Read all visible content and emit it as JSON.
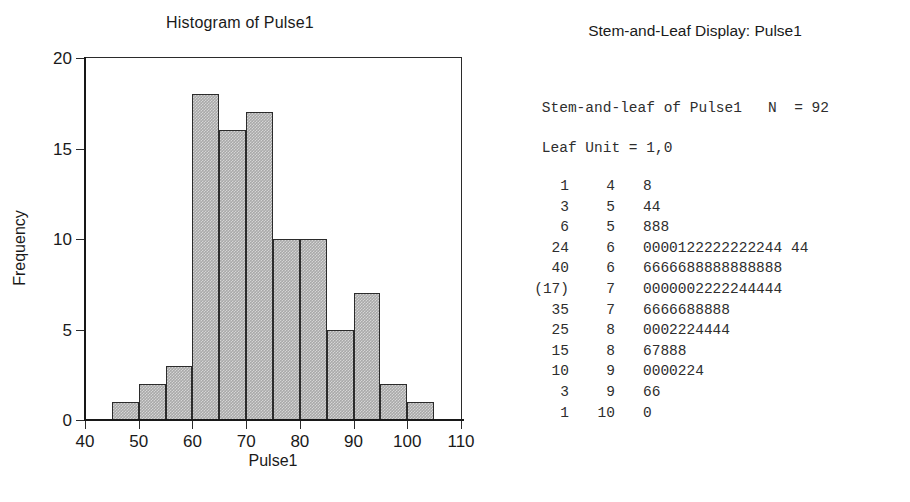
{
  "histogram": {
    "title": "Histogram of Pulse1",
    "xlabel": "Pulse1",
    "ylabel": "Frequency"
  },
  "stemleaf": {
    "title": "Stem-and-Leaf Display: Pulse1",
    "header_line1": "Stem-and-leaf of Pulse1   N  = 92",
    "header_line2": "Leaf Unit = 1,0",
    "rows": [
      {
        "count": "1",
        "stem": "4",
        "leaves": "8"
      },
      {
        "count": "3",
        "stem": "5",
        "leaves": "44"
      },
      {
        "count": "6",
        "stem": "5",
        "leaves": "888"
      },
      {
        "count": "24",
        "stem": "6",
        "leaves": "0000122222222244 44"
      },
      {
        "count": "40",
        "stem": "6",
        "leaves": "6666688888888888"
      },
      {
        "count": "(17)",
        "stem": "7",
        "leaves": "0000002222244444"
      },
      {
        "count": "35",
        "stem": "7",
        "leaves": "6666688888"
      },
      {
        "count": "25",
        "stem": "8",
        "leaves": "0002224444"
      },
      {
        "count": "15",
        "stem": "8",
        "leaves": "67888"
      },
      {
        "count": "10",
        "stem": "9",
        "leaves": "0000224"
      },
      {
        "count": "3",
        "stem": "9",
        "leaves": "66"
      },
      {
        "count": "1",
        "stem": "10",
        "leaves": "0"
      }
    ]
  },
  "chart_data": {
    "type": "bar",
    "title": "Histogram of Pulse1",
    "xlabel": "Pulse1",
    "ylabel": "Frequency",
    "xlim": [
      40,
      110
    ],
    "ylim": [
      0,
      20
    ],
    "xticks": [
      40,
      50,
      60,
      70,
      80,
      90,
      100,
      110
    ],
    "yticks": [
      0,
      5,
      10,
      15,
      20
    ],
    "grid": false,
    "legend": null,
    "bin_width": 5,
    "bin_edges": [
      45,
      50,
      55,
      60,
      65,
      70,
      75,
      80,
      85,
      90,
      95,
      100,
      105
    ],
    "categories": [
      "45-50",
      "50-55",
      "55-60",
      "60-65",
      "65-70",
      "70-75",
      "75-80",
      "80-85",
      "85-90",
      "90-95",
      "95-100",
      "100-105"
    ],
    "values": [
      1,
      2,
      3,
      18,
      16,
      17,
      10,
      10,
      5,
      7,
      2,
      1
    ],
    "n": 92,
    "bar_fill": "#a9a9a9",
    "bar_edge": "#2b2b2b"
  }
}
